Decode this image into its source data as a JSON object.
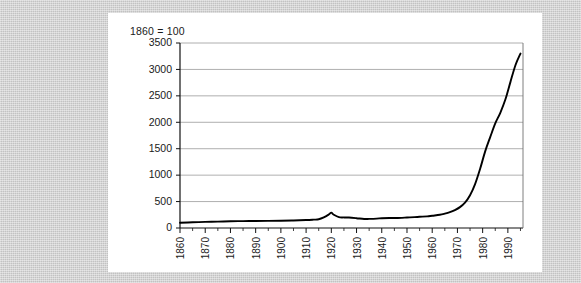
{
  "page": {
    "background_color": "#c9c9c9",
    "card_color": "#ffffff"
  },
  "chart_data": {
    "type": "line",
    "title": "1860 = 100",
    "xlabel": "",
    "ylabel": "",
    "xlim": [
      1860,
      1996
    ],
    "ylim": [
      0,
      3500
    ],
    "grid": true,
    "legend": "none",
    "line_color": "#000000",
    "y_ticks": [
      0,
      500,
      1000,
      1500,
      2000,
      2500,
      3000,
      3500
    ],
    "y_tick_labels": [
      "0",
      "500",
      "1000",
      "1500",
      "2000",
      "2500",
      "3000",
      "3500"
    ],
    "x_ticks": [
      1860,
      1870,
      1880,
      1890,
      1900,
      1910,
      1920,
      1930,
      1940,
      1950,
      1960,
      1970,
      1980,
      1990
    ],
    "x_tick_labels": [
      "1860",
      "1870",
      "1880",
      "1890",
      "1900",
      "1910",
      "1920",
      "1930",
      "1940",
      "1950",
      "1960",
      "1970",
      "1980",
      "1990"
    ],
    "x_minor_ticks": [
      1865,
      1875,
      1885,
      1895,
      1905,
      1915,
      1925,
      1935,
      1945,
      1955,
      1965,
      1975,
      1985,
      1995
    ],
    "x": [
      1860,
      1865,
      1870,
      1875,
      1880,
      1885,
      1890,
      1895,
      1900,
      1905,
      1910,
      1913,
      1915,
      1917,
      1919,
      1920,
      1921,
      1923,
      1925,
      1927,
      1930,
      1933,
      1935,
      1938,
      1940,
      1943,
      1945,
      1948,
      1950,
      1953,
      1955,
      1958,
      1960,
      1963,
      1965,
      1967,
      1969,
      1971,
      1973,
      1975,
      1977,
      1979,
      1981,
      1983,
      1985,
      1987,
      1989,
      1991,
      1993,
      1995
    ],
    "values": [
      100,
      108,
      115,
      120,
      128,
      130,
      133,
      135,
      138,
      142,
      150,
      158,
      165,
      200,
      255,
      290,
      250,
      205,
      200,
      198,
      185,
      170,
      172,
      178,
      185,
      190,
      188,
      192,
      198,
      205,
      212,
      220,
      232,
      250,
      272,
      300,
      340,
      395,
      480,
      620,
      830,
      1120,
      1450,
      1720,
      1980,
      2180,
      2430,
      2760,
      3080,
      3300
    ],
    "series": [
      {
        "name": "index",
        "values": [
          100,
          108,
          115,
          120,
          128,
          130,
          133,
          135,
          138,
          142,
          150,
          158,
          165,
          200,
          255,
          290,
          250,
          205,
          200,
          198,
          185,
          170,
          172,
          178,
          185,
          190,
          188,
          192,
          198,
          205,
          212,
          220,
          232,
          250,
          272,
          300,
          340,
          395,
          480,
          620,
          830,
          1120,
          1450,
          1720,
          1980,
          2180,
          2430,
          2760,
          3080,
          3300
        ]
      }
    ]
  }
}
